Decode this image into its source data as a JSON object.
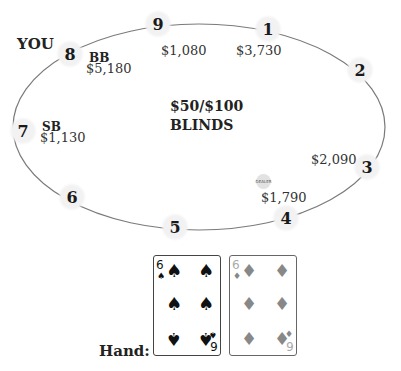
{
  "you_label": "YOU",
  "blinds": {
    "line1": "$50/$100",
    "line2": "BLINDS"
  },
  "dealer_button": {
    "label": "DEALER",
    "seat": 4
  },
  "seats": [
    {
      "number": "1",
      "stack": "$3,730",
      "position": ""
    },
    {
      "number": "2",
      "stack": "",
      "position": ""
    },
    {
      "number": "3",
      "stack": "$2,090",
      "position": ""
    },
    {
      "number": "4",
      "stack": "$1,790",
      "position": ""
    },
    {
      "number": "5",
      "stack": "",
      "position": ""
    },
    {
      "number": "6",
      "stack": "",
      "position": ""
    },
    {
      "number": "7",
      "stack": "$1,130",
      "position": "SB"
    },
    {
      "number": "8",
      "stack": "$5,180",
      "position": "BB"
    },
    {
      "number": "9",
      "stack": "$1,080",
      "position": ""
    }
  ],
  "hand": {
    "label": "Hand:",
    "cards": [
      {
        "rank": "6",
        "suit": "spades",
        "suit_glyph": "♠",
        "color": "#111111"
      },
      {
        "rank": "6",
        "suit": "diamonds",
        "suit_glyph": "♦",
        "color": "#888888"
      }
    ]
  },
  "colors": {
    "table_line": "#777777",
    "seat_bg": "#f2f2f2",
    "spade": "#111111",
    "diamond": "#888888"
  }
}
